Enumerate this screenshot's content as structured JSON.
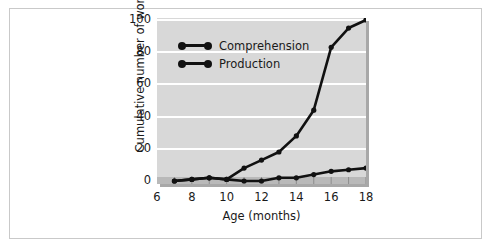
{
  "chart_data": {
    "type": "line",
    "title": "",
    "xlabel": "Age (months)",
    "ylabel": "Cumulative number of words",
    "xlim": [
      6,
      18
    ],
    "ylim": [
      0,
      100
    ],
    "xticks": [
      6,
      8,
      10,
      12,
      14,
      16,
      18
    ],
    "yticks": [
      0,
      20,
      40,
      60,
      80,
      100
    ],
    "xtick_labels": [
      "6",
      "8",
      "10",
      "12",
      "14",
      "16",
      "18"
    ],
    "ytick_labels": [
      "0",
      "20",
      "40",
      "60",
      "80",
      "100"
    ],
    "xtick_minor_step": 1,
    "grid": "horizontal",
    "legend_position": "upper-left",
    "x": [
      7,
      8,
      9,
      10,
      11,
      12,
      13,
      14,
      15,
      16,
      17,
      18
    ],
    "series": [
      {
        "name": "Comprehension",
        "color": "#111111",
        "x": [
          7,
          8,
          9,
          10,
          11,
          12,
          13,
          14,
          15,
          16,
          17,
          18
        ],
        "values": [
          0,
          1,
          2,
          1,
          8,
          13,
          18,
          28,
          44,
          83,
          95,
          100
        ]
      },
      {
        "name": "Production",
        "color": "#111111",
        "x": [
          7,
          8,
          9,
          10,
          11,
          12,
          13,
          14,
          15,
          16,
          17,
          18
        ],
        "values": [
          0,
          1,
          2,
          1,
          0,
          0,
          2,
          2,
          4,
          6,
          7,
          8
        ]
      }
    ],
    "colors": {
      "plot_background": "#d8d8d8",
      "gridline": "#ffffff",
      "axis_strip": "#b9b9b9",
      "shadow": "#a8a8a8",
      "line": "#111111",
      "frame_border": "#c9c9c9",
      "page_background": "#ffffff",
      "text": "#1a1a1a"
    }
  },
  "legend": {
    "items": [
      {
        "label": "Comprehension"
      },
      {
        "label": "Production"
      }
    ]
  },
  "axes": {
    "y_label": "Cumulative number of words",
    "x_label": "Age (months)"
  }
}
